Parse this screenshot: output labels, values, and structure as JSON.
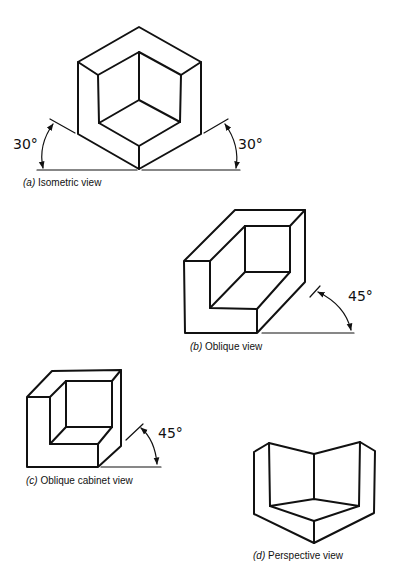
{
  "figures": [
    {
      "id": "a",
      "letter": "(a)",
      "caption": "Isometric view",
      "angles": [
        "30°",
        "30°"
      ]
    },
    {
      "id": "b",
      "letter": "(b)",
      "caption": "Oblique view",
      "angles": [
        "45°"
      ]
    },
    {
      "id": "c",
      "letter": "(c)",
      "caption": "Oblique cabinet view",
      "angles": [
        "45°"
      ]
    },
    {
      "id": "d",
      "letter": "(d)",
      "caption": "Perspective view",
      "angles": []
    }
  ],
  "colors": {
    "line": "#111111",
    "background": "#ffffff"
  }
}
